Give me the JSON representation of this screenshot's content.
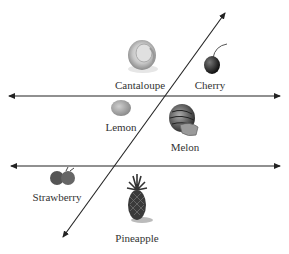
{
  "diagram": {
    "type": "venn-like line partition",
    "lines": [
      {
        "id": "horizontal-top",
        "from": [
          8,
          96
        ],
        "to": [
          281,
          96
        ],
        "arrows": "both"
      },
      {
        "id": "horizontal-bottom",
        "from": [
          10,
          166
        ],
        "to": [
          281,
          166
        ],
        "arrows": "both"
      },
      {
        "id": "diagonal",
        "from": [
          62,
          238
        ],
        "to": [
          226,
          12
        ],
        "arrows": "both"
      }
    ],
    "items": [
      {
        "name": "Cantaloupe",
        "label": "Cantaloupe",
        "x": 140,
        "y": 78,
        "icon": "cantaloupe-icon"
      },
      {
        "name": "Cherry",
        "label": "Cherry",
        "x": 210,
        "y": 78,
        "icon": "cherry-icon"
      },
      {
        "name": "Lemon",
        "label": "Lemon",
        "x": 121,
        "y": 121,
        "icon": "lemon-icon"
      },
      {
        "name": "Melon",
        "label": "Melon",
        "x": 185,
        "y": 142,
        "icon": "melon-icon"
      },
      {
        "name": "Strawberry",
        "label": "Strawberry",
        "x": 58,
        "y": 192,
        "icon": "strawberry-icon"
      },
      {
        "name": "Pineapple",
        "label": "Pineapple",
        "x": 137,
        "y": 233,
        "icon": "pineapple-icon"
      }
    ]
  }
}
